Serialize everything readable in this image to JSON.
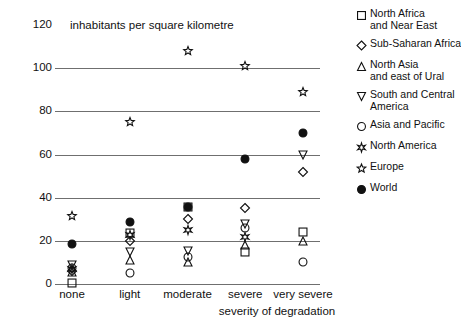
{
  "chart_data": {
    "type": "scatter",
    "title": "",
    "ylabel": "inhabitants per square kilometre",
    "xlabel": "severity of degradation",
    "categories": [
      "none",
      "light",
      "moderate",
      "severe",
      "very severe"
    ],
    "yticks": [
      0,
      20,
      40,
      60,
      80,
      100,
      120
    ],
    "ylim": [
      0,
      120
    ],
    "grid": true,
    "legend_position": "right",
    "series": [
      {
        "name": "North Africa\nand Near East",
        "marker": "square-open",
        "values": [
          0.5,
          23.5,
          35.5,
          15,
          24
        ]
      },
      {
        "name": "Sub-Saharan Africa",
        "marker": "diamond-open",
        "values": [
          6,
          20,
          30,
          35,
          52
        ]
      },
      {
        "name": "North Asia\nand east of Ural",
        "marker": "triangle-up-open",
        "values": [
          5.5,
          11,
          10,
          18,
          20
        ]
      },
      {
        "name": "South and Central\nAmerica",
        "marker": "triangle-down-open",
        "values": [
          9,
          15,
          15.5,
          28,
          60
        ]
      },
      {
        "name": "Asia and Pacific",
        "marker": "circle-open",
        "values": [
          7.5,
          5,
          12.5,
          26,
          10
        ]
      },
      {
        "name": "North America",
        "marker": "star-plus-open",
        "values": [
          7,
          22.5,
          25,
          22,
          null
        ]
      },
      {
        "name": "Europe",
        "marker": "star-open",
        "values": [
          31.5,
          75,
          108,
          101,
          89
        ]
      },
      {
        "name": "World",
        "marker": "circle-filled",
        "values": [
          18.5,
          28.5,
          35.5,
          58,
          70
        ]
      }
    ]
  },
  "legend": {
    "items": [
      {
        "marker": "square-open",
        "lines": [
          "North Africa",
          "and Near East"
        ]
      },
      {
        "marker": "diamond-open",
        "lines": [
          "Sub-Saharan Africa"
        ]
      },
      {
        "marker": "triangle-up-open",
        "lines": [
          "North Asia",
          "and east of Ural"
        ]
      },
      {
        "marker": "triangle-down-open",
        "lines": [
          "South and Central",
          "America"
        ]
      },
      {
        "marker": "circle-open",
        "lines": [
          "Asia and Pacific"
        ]
      },
      {
        "marker": "star-plus-open",
        "lines": [
          "North America"
        ]
      },
      {
        "marker": "star-open",
        "lines": [
          "Europe"
        ]
      },
      {
        "marker": "circle-filled",
        "lines": [
          "World"
        ]
      }
    ]
  }
}
